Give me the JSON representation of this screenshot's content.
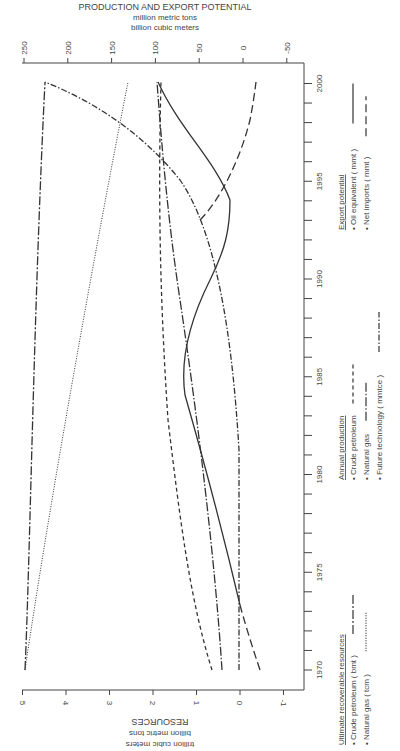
{
  "chart_data": {
    "type": "line",
    "orientation": "rotated-90-clockwise",
    "title": "PRODUCTION AND EXPORT POTENTIAL",
    "top_axis": {
      "label_lines": [
        "PRODUCTION AND EXPORT POTENTIAL",
        "million metric tons",
        "billion cubic meters"
      ],
      "ticks": [
        250,
        200,
        150,
        100,
        50,
        0,
        -50
      ],
      "range": [
        -65,
        255
      ]
    },
    "bottom_axis": {
      "label_lines": [
        "RESOURCES",
        "billion metric tons",
        "trillion cubic meters"
      ],
      "ticks": [
        5,
        4,
        3,
        2,
        1,
        0,
        -1
      ],
      "range": [
        -1.5,
        5.1
      ]
    },
    "year_axis": {
      "ticks": [
        1970,
        1975,
        1980,
        1985,
        1990,
        1995,
        2000
      ],
      "range": [
        1969,
        2001
      ]
    },
    "x": [
      1970,
      1975,
      1980,
      1985,
      1990,
      1995,
      2000
    ],
    "series": [
      {
        "group": "Ultimate recoverable resources",
        "name": "Crude petroleum (bmt)",
        "axis": "resources",
        "dash": "long-short",
        "values": [
          5.0,
          4.95,
          4.9,
          4.85,
          4.8,
          4.65,
          4.5
        ]
      },
      {
        "group": "Ultimate recoverable resources",
        "name": "Natural gas (tcm)",
        "axis": "resources",
        "dash": "dotted",
        "values": [
          5.0,
          4.6,
          4.2,
          3.8,
          3.4,
          3.0,
          2.6
        ]
      },
      {
        "group": "Annual production",
        "name": "Crude petroleum",
        "axis": "production",
        "dash": "short-dash",
        "values": [
          35,
          85,
          112,
          125,
          125,
          115,
          92
        ]
      },
      {
        "group": "Annual production",
        "name": "Natural gas",
        "axis": "production",
        "dash": "long-dash-dot",
        "values": [
          23,
          30,
          55,
          80,
          105,
          112,
          100
        ]
      },
      {
        "group": "Annual production",
        "name": "Future technology (mmtce)",
        "axis": "production",
        "dash": "dash-dot",
        "values": [
          0,
          2,
          10,
          40,
          85,
          150,
          240
        ]
      },
      {
        "group": "Export potential",
        "name": "Oil equivalent (mmt)",
        "axis": "production",
        "dash": "solid",
        "values": [
          -20,
          10,
          25,
          25,
          45,
          90,
          95
        ]
      },
      {
        "group": "Export potential",
        "name": "Net imports (mmt)",
        "axis": "production",
        "dash": "long-dash",
        "values": [
          -20,
          -10,
          null,
          null,
          45,
          8,
          -15
        ]
      }
    ]
  },
  "legend": {
    "groups": [
      {
        "title": "Ultimate recoverable resources",
        "items": [
          "Crude petroleum ( bmt )",
          "Natural gas ( tcm )"
        ]
      },
      {
        "title": "Annual production",
        "items": [
          "Crude petroleum",
          "Natural gas",
          "Future technology ( mmtce )"
        ]
      },
      {
        "title": "Export potential",
        "items": [
          "Oil equivalent ( mmt )",
          "Net imports ( mmt )"
        ]
      }
    ]
  },
  "colors": {
    "ink": "#333333",
    "background": "#ffffff"
  }
}
